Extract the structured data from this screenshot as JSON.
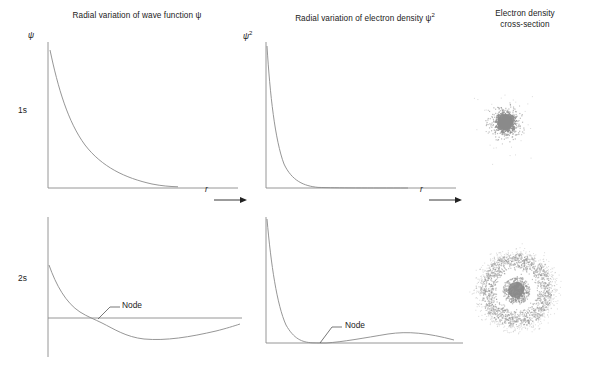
{
  "figure": {
    "width": 594,
    "height": 376,
    "background": "#ffffff",
    "curve_color": "#8a8a8a",
    "axis_color": "#8a8a8a",
    "text_color": "#222222",
    "dot_color": "#8f8f8f"
  },
  "column_titles": {
    "col1": "Radial variation of wave function ψ",
    "col2": "Radial variation of electron density ψ",
    "col2_exponent": "2",
    "col3_line1": "Electron density",
    "col3_line2": "cross-section"
  },
  "row_labels": {
    "row1": "1s",
    "row2": "2s"
  },
  "axis_labels": {
    "y_col1": "ψ",
    "y_col2": "ψ",
    "y_col2_exponent": "2",
    "x_label": "r",
    "x_arrow": "⟶"
  },
  "annotations": {
    "node_1s": "Node",
    "node_2s": "Node"
  },
  "chart_data": [
    {
      "id": "1s-psi",
      "type": "line",
      "title": "Radial variation of wave function ψ",
      "row": "1s",
      "xlabel": "r",
      "ylabel": "ψ",
      "description": "Simple exponential decay, always positive, no node",
      "xlim": [
        0,
        10
      ],
      "ylim": [
        0,
        1
      ],
      "grid": false,
      "legend": false,
      "x": [
        0,
        0.5,
        1,
        1.5,
        2,
        2.5,
        3,
        3.5,
        4,
        4.5,
        5,
        5.5,
        6,
        6.5,
        7
      ],
      "y": [
        1.0,
        0.78,
        0.61,
        0.47,
        0.37,
        0.29,
        0.22,
        0.17,
        0.14,
        0.11,
        0.08,
        0.06,
        0.05,
        0.04,
        0.03
      ]
    },
    {
      "id": "1s-psi2",
      "type": "line",
      "title": "Radial variation of electron density ψ²",
      "row": "1s",
      "xlabel": "r",
      "ylabel": "ψ²",
      "description": "Squared exponential decay, steeper, always positive, no node",
      "xlim": [
        0,
        10
      ],
      "ylim": [
        0,
        1
      ],
      "grid": false,
      "legend": false,
      "x": [
        0,
        0.5,
        1,
        1.5,
        2,
        2.5,
        3,
        3.5,
        4,
        4.5,
        5,
        6,
        7,
        8,
        9
      ],
      "y": [
        1.0,
        0.61,
        0.37,
        0.22,
        0.14,
        0.08,
        0.05,
        0.03,
        0.02,
        0.012,
        0.007,
        0.003,
        0.001,
        0.0005,
        0.0
      ]
    },
    {
      "id": "2s-psi",
      "type": "line",
      "title": "Radial variation of wave function ψ",
      "row": "2s",
      "xlabel": "r",
      "ylabel": "ψ",
      "description": "Starts positive, crosses zero at the radial node, goes negative with a shallow minimum, then approaches zero from below",
      "xlim": [
        0,
        12
      ],
      "ylim": [
        -0.25,
        0.62
      ],
      "grid": false,
      "legend": false,
      "node_x": 3.1,
      "x": [
        0,
        0.5,
        1,
        1.5,
        2,
        2.5,
        3,
        3.1,
        3.5,
        4,
        4.5,
        5,
        5.5,
        6,
        7,
        8,
        9,
        10,
        11,
        12
      ],
      "y": [
        0.6,
        0.45,
        0.33,
        0.24,
        0.16,
        0.08,
        0.01,
        0.0,
        -0.05,
        -0.1,
        -0.14,
        -0.17,
        -0.18,
        -0.19,
        -0.185,
        -0.17,
        -0.15,
        -0.13,
        -0.11,
        -0.09
      ]
    },
    {
      "id": "2s-psi2",
      "type": "line",
      "title": "Radial variation of electron density ψ²",
      "row": "2s",
      "xlabel": "r",
      "ylabel": "ψ²",
      "description": "Sharp inner peak decaying to zero at the radial node, then a broad low second maximum",
      "xlim": [
        0,
        12
      ],
      "ylim": [
        0,
        1
      ],
      "grid": false,
      "legend": false,
      "node_x": 3.1,
      "x": [
        0,
        0.4,
        0.8,
        1.2,
        1.6,
        2.0,
        2.5,
        3.1,
        3.6,
        4.2,
        5,
        6,
        7,
        8,
        9,
        10,
        11,
        12
      ],
      "y": [
        1.0,
        0.56,
        0.31,
        0.17,
        0.09,
        0.045,
        0.012,
        0.0,
        0.015,
        0.035,
        0.065,
        0.1,
        0.115,
        0.11,
        0.1,
        0.085,
        0.065,
        0.045
      ]
    },
    {
      "id": "1s-cloud",
      "type": "scatter",
      "title": "Electron density cross-section",
      "row": "1s",
      "description": "Dense spherical dot cloud with maximum density at the nucleus, fading outward; no node",
      "points_count": 1400,
      "center": [
        505,
        122
      ],
      "core_radius": 11,
      "outer_radius": 34
    },
    {
      "id": "2s-cloud",
      "type": "scatter",
      "title": "Electron density cross-section",
      "row": "2s",
      "description": "Small dense core at the nucleus, a clear spherical node gap, then a broad outer shell of dots",
      "points_count": 2200,
      "center": [
        516,
        290
      ],
      "core_radius": 8,
      "node_radius": 17,
      "shell_inner": 19,
      "shell_outer": 50
    }
  ]
}
